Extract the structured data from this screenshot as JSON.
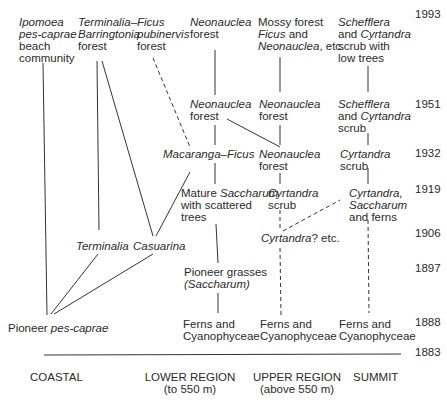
{
  "diagram": {
    "years": [
      "1993",
      "1951",
      "1932",
      "1919",
      "1906",
      "1897",
      "1888",
      "1883"
    ],
    "zones": {
      "coastal": "COASTAL",
      "lower_region": "LOWER REGION",
      "lower_region_sub": "(to 550 m)",
      "upper_region": "UPPER REGION",
      "upper_region_sub": "(above 550 m)",
      "summit": "SUMMIT"
    },
    "nodes": {
      "ipomoea": {
        "l1": "Ipomoea",
        "l2": "pes-caprae",
        "l3": "beach",
        "l4": "community"
      },
      "term_barr": {
        "l1": "Terminalia–",
        "l2": "Barringtonia",
        "l3": "forest"
      },
      "ficus_pub": {
        "l1": "Ficus",
        "l2": "pubinervis",
        "l3": "forest"
      },
      "neon_1993": {
        "l1": "Neonauclea",
        "l2": "forest"
      },
      "mossy_1993": {
        "l1": "Mossy forest",
        "l2a": "Ficus",
        "l2b": " and",
        "l3a": "Neonauclea",
        "l3b": ", etc."
      },
      "scheff_1993": {
        "l1": "Schefflera",
        "l2a": "and ",
        "l2b": "Cyrtandra",
        "l3": "scrub with",
        "l4": "low trees"
      },
      "neon_lower_1951": {
        "l1": "Neonauclea",
        "l2": "forest"
      },
      "neon_upper_1951": {
        "l1": "Neonauclea",
        "l2": "forest"
      },
      "scheff_1951": {
        "l1": "Schefflera",
        "l2a": "and ",
        "l2b": "Cyrtandra",
        "l3": "scrub"
      },
      "macaranga": {
        "l1": "Macaranga–Ficus"
      },
      "neon_upper_1932": {
        "l1": "Neonauclea",
        "l2": "forest"
      },
      "cyrt_summit_1932": {
        "l1": "Cyrtandra",
        "l2": "scrub"
      },
      "mature_sacch": {
        "l1a": "Mature ",
        "l1b": "Saccharum",
        "l2": "with scattered",
        "l3": "trees"
      },
      "cyrt_upper_1919": {
        "l1": "Cyrtandra",
        "l2": "scrub"
      },
      "cyrt_summit_1919": {
        "l1": "Cyrtandra,",
        "l2": "Saccharum",
        "l3": "and ferns"
      },
      "terminalia": {
        "l1": "Terminalia"
      },
      "casuarina": {
        "l1": "Casuarina"
      },
      "cyrt_1906": {
        "l1a": "Cyrtandra",
        "l1b": "? etc."
      },
      "pioneer_grasses": {
        "l1": "Pioneer grasses",
        "l2": "(Saccharum)"
      },
      "pioneer_pes": {
        "l1a": "Pioneer ",
        "l1b": "pes-caprae"
      },
      "ferns_lower": {
        "l1": "Ferns and",
        "l2": "Cyanophyceae"
      },
      "ferns_upper": {
        "l1": "Ferns and",
        "l2": "Cyanophyceae"
      },
      "ferns_summit": {
        "l1": "Ferns and",
        "l2": "Cyanophyceae"
      }
    }
  }
}
